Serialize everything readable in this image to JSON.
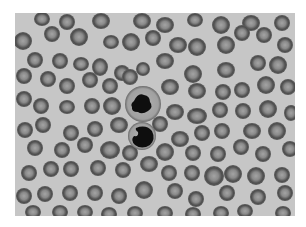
{
  "image": {
    "description": "Grayscale blood smear micrograph showing red blood cells and two leukocytes",
    "frame": {
      "x": 15,
      "y": 13,
      "width": 280,
      "height": 203
    },
    "colors": {
      "page": "#ffffff",
      "background": "#c6c6c6",
      "rbc_rim": "#505050",
      "rbc_center": "#9a9a9a",
      "wbc_cytoplasm": "#a8a8a8",
      "wbc_nucleus": "#0e0e0e"
    },
    "leukocytes": [
      {
        "cx": 128,
        "cy": 91,
        "r": 18,
        "nucleus": "lobed"
      },
      {
        "cx": 127,
        "cy": 123,
        "r": 14,
        "nucleus": "dense"
      }
    ],
    "rbcs": [
      [
        27,
        6,
        8,
        7
      ],
      [
        52,
        9,
        8,
        8
      ],
      [
        86,
        8,
        9,
        8
      ],
      [
        127,
        8,
        9,
        8
      ],
      [
        150,
        12,
        9,
        8
      ],
      [
        180,
        7,
        8,
        7
      ],
      [
        206,
        12,
        9,
        9
      ],
      [
        236,
        10,
        9,
        8
      ],
      [
        267,
        10,
        8,
        8
      ],
      [
        8,
        28,
        9,
        9
      ],
      [
        37,
        21,
        8,
        8
      ],
      [
        64,
        24,
        9,
        9
      ],
      [
        96,
        29,
        8,
        7
      ],
      [
        116,
        29,
        9,
        9
      ],
      [
        138,
        25,
        8,
        8
      ],
      [
        163,
        32,
        9,
        8
      ],
      [
        182,
        34,
        9,
        9
      ],
      [
        211,
        32,
        9,
        9
      ],
      [
        227,
        20,
        8,
        8
      ],
      [
        249,
        22,
        8,
        8
      ],
      [
        270,
        32,
        8,
        8
      ],
      [
        20,
        47,
        8,
        8
      ],
      [
        45,
        48,
        8,
        8
      ],
      [
        66,
        51,
        8,
        7
      ],
      [
        85,
        54,
        8,
        9
      ],
      [
        107,
        60,
        8,
        8
      ],
      [
        128,
        56,
        7,
        7
      ],
      [
        150,
        48,
        9,
        8
      ],
      [
        178,
        61,
        9,
        9
      ],
      [
        211,
        57,
        9,
        8
      ],
      [
        243,
        50,
        8,
        8
      ],
      [
        263,
        52,
        9,
        9
      ],
      [
        9,
        63,
        8,
        8
      ],
      [
        33,
        66,
        8,
        8
      ],
      [
        52,
        73,
        8,
        8
      ],
      [
        75,
        67,
        8,
        8
      ],
      [
        95,
        73,
        8,
        8
      ],
      [
        115,
        64,
        8,
        8
      ],
      [
        155,
        74,
        9,
        8
      ],
      [
        182,
        78,
        9,
        8
      ],
      [
        208,
        79,
        8,
        8
      ],
      [
        227,
        77,
        8,
        8
      ],
      [
        251,
        72,
        9,
        9
      ],
      [
        273,
        74,
        8,
        8
      ],
      [
        9,
        86,
        8,
        8
      ],
      [
        26,
        93,
        8,
        8
      ],
      [
        52,
        94,
        8,
        7
      ],
      [
        77,
        93,
        8,
        8
      ],
      [
        97,
        93,
        9,
        9
      ],
      [
        160,
        99,
        9,
        8
      ],
      [
        182,
        103,
        10,
        8
      ],
      [
        205,
        97,
        8,
        8
      ],
      [
        228,
        98,
        8,
        8
      ],
      [
        253,
        96,
        9,
        9
      ],
      [
        276,
        100,
        7,
        8
      ],
      [
        10,
        117,
        8,
        8
      ],
      [
        28,
        112,
        8,
        8
      ],
      [
        56,
        120,
        8,
        8
      ],
      [
        80,
        116,
        8,
        8
      ],
      [
        104,
        112,
        9,
        8
      ],
      [
        145,
        111,
        8,
        8
      ],
      [
        165,
        126,
        9,
        8
      ],
      [
        187,
        120,
        8,
        8
      ],
      [
        207,
        118,
        8,
        8
      ],
      [
        237,
        118,
        9,
        8
      ],
      [
        262,
        118,
        9,
        9
      ],
      [
        20,
        135,
        8,
        8
      ],
      [
        47,
        137,
        8,
        8
      ],
      [
        70,
        132,
        8,
        8
      ],
      [
        95,
        137,
        10,
        9
      ],
      [
        115,
        140,
        8,
        8
      ],
      [
        150,
        139,
        9,
        9
      ],
      [
        178,
        140,
        8,
        8
      ],
      [
        203,
        141,
        8,
        8
      ],
      [
        226,
        134,
        8,
        8
      ],
      [
        248,
        141,
        8,
        8
      ],
      [
        275,
        136,
        8,
        8
      ],
      [
        14,
        160,
        8,
        8
      ],
      [
        36,
        156,
        8,
        8
      ],
      [
        56,
        156,
        8,
        8
      ],
      [
        83,
        155,
        8,
        8
      ],
      [
        108,
        157,
        8,
        8
      ],
      [
        134,
        151,
        9,
        8
      ],
      [
        154,
        160,
        8,
        8
      ],
      [
        177,
        160,
        8,
        8
      ],
      [
        199,
        163,
        10,
        10
      ],
      [
        218,
        161,
        9,
        9
      ],
      [
        241,
        163,
        9,
        9
      ],
      [
        267,
        162,
        8,
        8
      ],
      [
        9,
        183,
        8,
        8
      ],
      [
        30,
        181,
        8,
        8
      ],
      [
        55,
        180,
        8,
        8
      ],
      [
        80,
        180,
        8,
        8
      ],
      [
        104,
        183,
        8,
        8
      ],
      [
        129,
        177,
        9,
        9
      ],
      [
        160,
        178,
        8,
        8
      ],
      [
        181,
        186,
        8,
        8
      ],
      [
        212,
        180,
        8,
        8
      ],
      [
        243,
        184,
        8,
        8
      ],
      [
        270,
        180,
        8,
        8
      ],
      [
        18,
        199,
        8,
        7
      ],
      [
        45,
        199,
        8,
        7
      ],
      [
        70,
        199,
        8,
        7
      ],
      [
        94,
        201,
        8,
        7
      ],
      [
        120,
        200,
        8,
        7
      ],
      [
        150,
        200,
        8,
        7
      ],
      [
        178,
        201,
        8,
        7
      ],
      [
        206,
        200,
        8,
        7
      ],
      [
        230,
        198,
        8,
        7
      ],
      [
        268,
        200,
        8,
        7
      ]
    ]
  }
}
